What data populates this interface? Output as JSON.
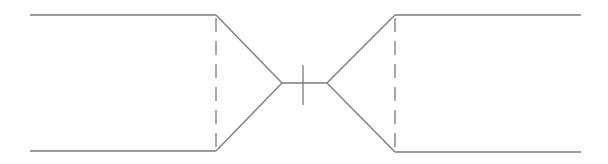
{
  "diagram": {
    "type": "symmetric-nozzle-throat-schematic",
    "stroke_color": "#7a7a7a",
    "background": "#ffffff",
    "left_channel": {
      "top_line": [
        30,
        15,
        216,
        15
      ],
      "bottom_line": [
        30,
        151,
        216,
        151
      ],
      "taper_top": [
        216,
        15,
        282,
        83
      ],
      "taper_bottom": [
        216,
        151,
        282,
        83
      ],
      "dashed_section": [
        216,
        15,
        216,
        151
      ]
    },
    "throat": {
      "line": [
        282,
        83,
        327,
        83
      ],
      "tick": [
        303,
        65,
        303,
        105
      ]
    },
    "right_channel": {
      "top_line": [
        395,
        15,
        581,
        15
      ],
      "bottom_line": [
        395,
        152,
        581,
        152
      ],
      "taper_top": [
        327,
        83,
        395,
        15
      ],
      "taper_bottom": [
        327,
        83,
        395,
        152
      ],
      "dashed_section": [
        395,
        15,
        395,
        152
      ]
    },
    "dash_pattern": "14 9"
  }
}
